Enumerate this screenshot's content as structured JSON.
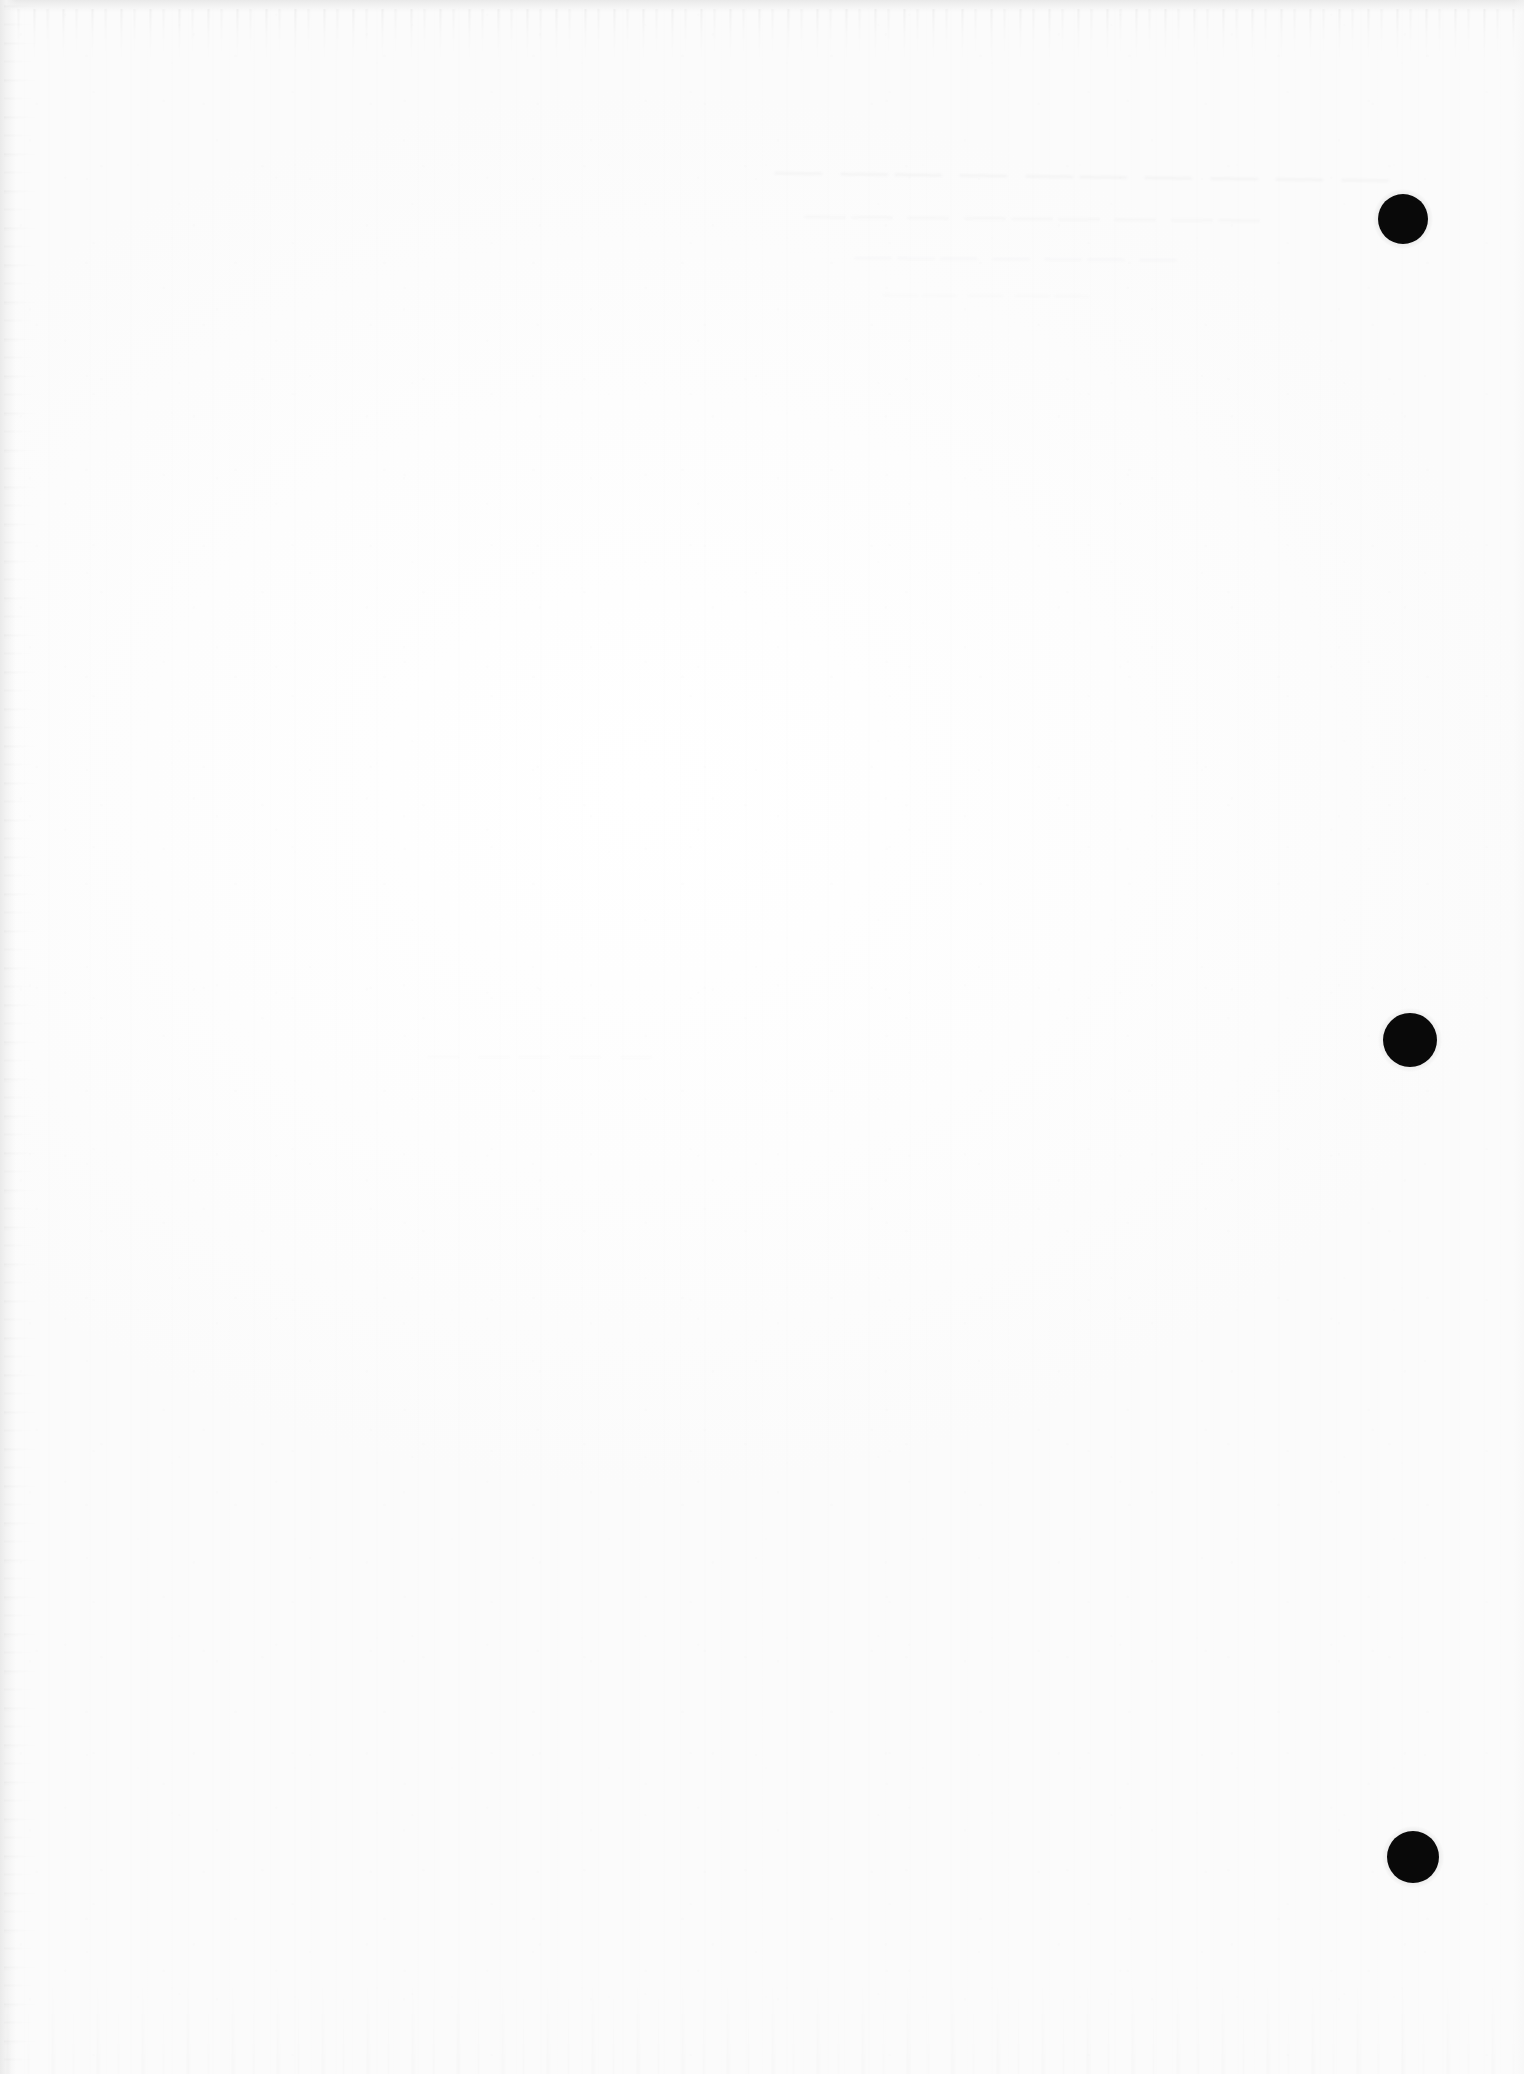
{
  "page": {
    "document_type": "scanned-page",
    "orientation": "portrait",
    "width_px": 1524,
    "height_px": 2074,
    "paper_color": "#fdfdfd",
    "ink_color": "#0a0a0a",
    "edge_shadow_color": "#e9e9e9",
    "body_text": "",
    "body_note": "Page is blank — no printed or handwritten body text is rendered in the pixels."
  },
  "artifacts": {
    "punch_holes": [
      {
        "label": "punch-hole-top",
        "cx": 1403,
        "cy": 219,
        "d": 50,
        "color": "#0a0a0a"
      },
      {
        "label": "punch-hole-middle",
        "cx": 1410,
        "cy": 1040,
        "d": 54,
        "color": "#0a0a0a"
      },
      {
        "label": "punch-hole-bottom",
        "cx": 1413,
        "cy": 1857,
        "d": 52,
        "color": "#0a0a0a"
      }
    ],
    "ghost_marks": {
      "description": "Faint show-through / bleed marks from the reverse side of the sheet, near the top-centre. Not legible.",
      "region": {
        "x": 760,
        "y": 150,
        "w": 500,
        "h": 160
      },
      "lines": [
        "⸺ ⸺ ⸺ ⸺  ⸺⸺  ⸺ ⸺⸺ ⸺",
        "⸺⸺ ⸺ ⸺⸺⸺ ⸺ ⸺⸺",
        "⸺ ⸺⸺ ⸺ ⸺⸺⸺",
        "⸺⸺ ⸺ ⸺⸺",
        "⸺ ⸺ ⸺⸺ ⸺"
      ]
    },
    "edges": {
      "top_band": "light grey scan edge with downward fringe streaks",
      "left_band": "light grey scan edge strip",
      "bottom_band": "faint vertical streak texture",
      "right_band": "near-clean white margin"
    }
  }
}
